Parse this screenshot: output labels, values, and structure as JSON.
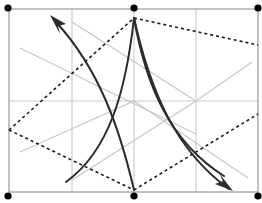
{
  "figure": {
    "width": 262,
    "height": 203,
    "background_color": "#ffffff",
    "frame": {
      "name": "outer-rectangle",
      "x": 9,
      "y": 9,
      "width": 249,
      "height": 183,
      "stroke_color": "#9a9a9a",
      "stroke_width": 1.2
    },
    "colors": {
      "frame": "#9a9a9a",
      "grid": "#c9c9c9",
      "guide": "#c4c4c4",
      "curve": "#2b2b2b",
      "dashed": "#1a1a1a",
      "dot": "#000000"
    },
    "grid_lines": [
      {
        "name": "grid-vertical-left",
        "x1": 72,
        "y1": 9,
        "x2": 72,
        "y2": 192
      },
      {
        "name": "grid-vertical-center",
        "x1": 134,
        "y1": 9,
        "x2": 134,
        "y2": 192
      },
      {
        "name": "grid-vertical-right",
        "x1": 196,
        "y1": 9,
        "x2": 196,
        "y2": 192
      },
      {
        "name": "grid-horizontal-mid",
        "x1": 9,
        "y1": 101,
        "x2": 258,
        "y2": 101
      }
    ],
    "guide_diagonals": [
      {
        "name": "guide-diagonal-upper-left",
        "x1": 20,
        "y1": 48,
        "x2": 134,
        "y2": 101
      },
      {
        "name": "guide-diagonal-lower-left",
        "x1": 20,
        "y1": 152,
        "x2": 134,
        "y2": 101
      },
      {
        "name": "guide-diagonal-upper-right",
        "x1": 134,
        "y1": 101,
        "x2": 248,
        "y2": 24
      },
      {
        "name": "guide-diagonal-lower-right",
        "x1": 134,
        "y1": 101,
        "x2": 248,
        "y2": 178
      },
      {
        "name": "guide-diagonal-top-span",
        "x1": 72,
        "y1": 22,
        "x2": 196,
        "y2": 101
      },
      {
        "name": "guide-diagonal-bottom-span",
        "x1": 72,
        "y1": 180,
        "x2": 196,
        "y2": 101
      }
    ],
    "dashed_polyline": {
      "name": "dashed-zigzag",
      "points": "9,130 134,18 196,101 258,45",
      "dash_pattern": "3 3",
      "stroke_width": 1.6,
      "segments": [
        {
          "name": "dash-segment-lower-left",
          "from": [
            9,
            130
          ],
          "to": [
            134,
            18
          ]
        },
        {
          "name": "dash-segment-upper-right",
          "from": [
            134,
            18
          ],
          "to": [
            258,
            45
          ]
        },
        {
          "name": "dash-segment-center-dip",
          "from": [
            9,
            130
          ],
          "to": [
            134,
            190
          ]
        }
      ]
    },
    "dashed_paths": [
      {
        "name": "dashed-path-left-up",
        "d": "M 9 130 L 134 18"
      },
      {
        "name": "dashed-path-top-right",
        "d": "M 134 18 L 258 45"
      },
      {
        "name": "dashed-path-bottom-left",
        "d": "M 9 130 L 134 190"
      },
      {
        "name": "dashed-path-bottom-mid",
        "d": "M 134 190 L 258 114"
      },
      {
        "name": "dashed-path-mid-right",
        "d": "M 134 101 L 258 45"
      }
    ],
    "curves": [
      {
        "name": "curve-arrow-upper-left",
        "d": "M 134 190 C 120 130, 100 70, 56 22",
        "stroke_width": 2.0,
        "arrow": {
          "name": "arrowhead-upper-left",
          "x": 52,
          "y": 17,
          "angle": -133
        }
      },
      {
        "name": "curve-long-sweep-left",
        "d": "M 134 18 C 126 90, 110 150, 66 182",
        "stroke_width": 2.0,
        "arrow": null
      },
      {
        "name": "curve-arrow-lower-right",
        "d": "M 134 18 C 150 90, 175 150, 229 189",
        "stroke_width": 2.0,
        "arrow": {
          "name": "arrowhead-lower-right",
          "x": 231,
          "y": 190,
          "angle": 42
        }
      },
      {
        "name": "curve-inner-sweep-right",
        "d": "M 134 18 C 146 86, 170 142, 224 176",
        "stroke_width": 2.0,
        "arrow": null
      }
    ],
    "dots": [
      {
        "name": "dot-top-left",
        "cx": 8,
        "cy": 8,
        "r": 3.6
      },
      {
        "name": "dot-top-center",
        "cx": 134,
        "cy": 8,
        "r": 3.6
      },
      {
        "name": "dot-top-right",
        "cx": 258,
        "cy": 8,
        "r": 3.6
      },
      {
        "name": "dot-bottom-left",
        "cx": 8,
        "cy": 196,
        "r": 3.6
      },
      {
        "name": "dot-bottom-center",
        "cx": 134,
        "cy": 196,
        "r": 3.6
      },
      {
        "name": "dot-bottom-right",
        "cx": 258,
        "cy": 196,
        "r": 3.6
      }
    ]
  }
}
